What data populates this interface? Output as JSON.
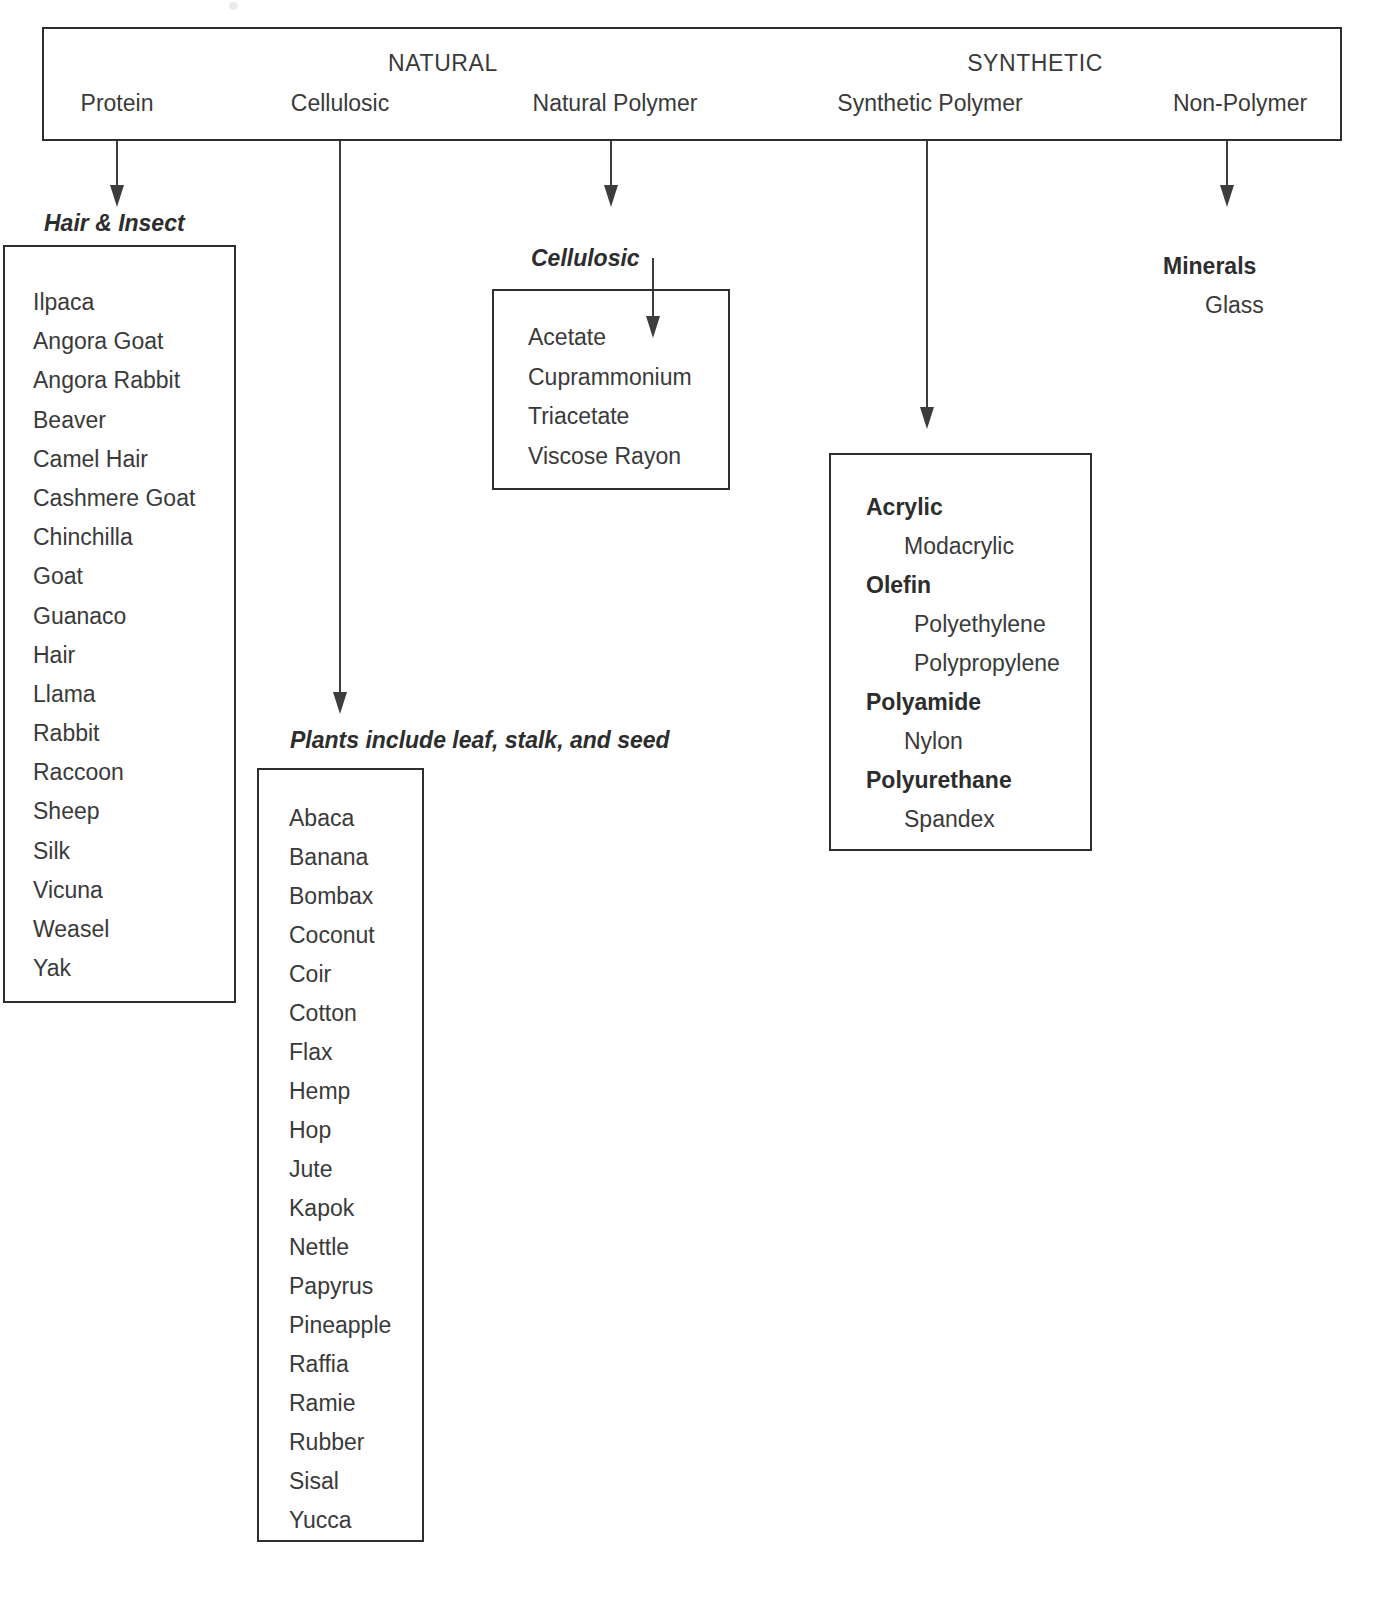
{
  "header": {
    "major_left": "NATURAL",
    "major_right": "SYNTHETIC",
    "columns": [
      {
        "label": "Protein"
      },
      {
        "label": "Cellulosic"
      },
      {
        "label": "Natural Polymer"
      },
      {
        "label": "Synthetic Polymer"
      },
      {
        "label": "Non-Polymer"
      }
    ]
  },
  "branches": {
    "protein": {
      "caption": "Hair & Insect",
      "items": [
        "Ilpaca",
        "Angora Goat",
        "Angora Rabbit",
        "Beaver",
        "Camel Hair",
        "Cashmere Goat",
        "Chinchilla",
        "Goat",
        "Guanaco",
        "Hair",
        "Llama",
        "Rabbit",
        "Raccoon",
        "Sheep",
        "Silk",
        "Vicuna",
        "Weasel",
        "Yak"
      ]
    },
    "cellulosic_natural": {
      "caption": "Plants include leaf, stalk, and seed",
      "items": [
        "Abaca",
        "Banana",
        "Bombax",
        "Coconut",
        "Coir",
        "Cotton",
        "Flax",
        "Hemp",
        "Hop",
        "Jute",
        "Kapok",
        "Nettle",
        "Papyrus",
        "Pineapple",
        "Raffia",
        "Ramie",
        "Rubber",
        "Sisal",
        "Yucca"
      ]
    },
    "natural_polymer": {
      "caption": "Cellulosic",
      "items": [
        "Acetate",
        "Cuprammonium",
        "Triacetate",
        "Viscose Rayon"
      ]
    },
    "synthetic_polymer": {
      "items": [
        {
          "text": "Acrylic",
          "style": "bold"
        },
        {
          "text": "Modacrylic",
          "style": "indent"
        },
        {
          "text": "Olefin",
          "style": "bold"
        },
        {
          "text": "Polyethylene",
          "style": "indent2"
        },
        {
          "text": "Polypropylene",
          "style": "indent2"
        },
        {
          "text": "Polyamide",
          "style": "bold"
        },
        {
          "text": "Nylon",
          "style": "indent"
        },
        {
          "text": "Polyurethane",
          "style": "bold"
        },
        {
          "text": "Spandex",
          "style": "indent"
        }
      ]
    },
    "non_polymer": {
      "heading": "Minerals",
      "sub": "Glass"
    }
  },
  "colors": {
    "ink": "#3a3a3a",
    "rule": "#2e2e2e",
    "page": "#ffffff"
  }
}
